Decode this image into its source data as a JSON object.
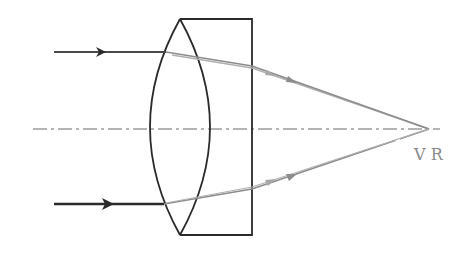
{
  "diagram": {
    "focus_label": "V R",
    "labels": {
      "violet": "V",
      "red": "R"
    },
    "colors": {
      "stroke_dark": "#2a2a2a",
      "ray_refracted": "#8c8c8c",
      "ray_refracted_light": "#b0b0b0",
      "axis": "#6a6a6a",
      "label": "#8a8a8a",
      "background": "#ffffff"
    },
    "components": [
      {
        "name": "biconvex-lens",
        "description": "converging lens element"
      },
      {
        "name": "glass-block",
        "description": "rectangular diverging/flint element"
      },
      {
        "name": "optical-axis",
        "description": "dash-dot principal axis"
      },
      {
        "name": "incident-ray-upper",
        "description": "parallel incoming ray"
      },
      {
        "name": "incident-ray-lower",
        "description": "parallel incoming ray"
      },
      {
        "name": "refracted-rays",
        "description": "converge to common focus V R"
      }
    ]
  }
}
